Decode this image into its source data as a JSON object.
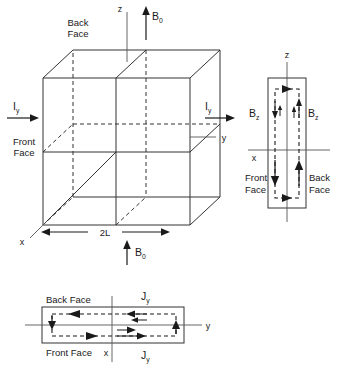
{
  "figure": {
    "panels": [
      "cube-perspective-panel",
      "side-view-panel",
      "top-view-panel"
    ]
  },
  "cube_panel": {
    "name": "cube-perspective-panel",
    "labels": {
      "back_face_line1": "Back",
      "back_face_line2": "Face",
      "front_face_line1": "Front",
      "front_face_line2": "Face",
      "axis_z": "z",
      "axis_x": "x",
      "axis_y": "y",
      "field_top": "B",
      "field_top_sub": "0",
      "field_bottom": "B",
      "field_bottom_sub": "0",
      "current_left": "I",
      "current_left_sub": "y",
      "current_right": "I",
      "current_right_sub": "y",
      "width_label": "2L"
    }
  },
  "side_panel": {
    "name": "side-view-panel",
    "labels": {
      "axis_z": "z",
      "axis_x": "x",
      "field_left": "B",
      "field_left_sub": "z",
      "field_right": "B",
      "field_right_sub": "z",
      "front_face_line1": "Front",
      "front_face_line2": "Face",
      "back_face_line1": "Back",
      "back_face_line2": "Face"
    }
  },
  "top_panel": {
    "name": "top-view-panel",
    "labels": {
      "back_face": "Back Face",
      "front_face": "Front Face",
      "axis_x": "x",
      "axis_y": "y",
      "current_top": "J",
      "current_top_sub": "y",
      "current_bottom": "J",
      "current_bottom_sub": "y"
    }
  },
  "colors": {
    "line": "#333333",
    "text": "#1a1a1a",
    "arrow": "#1a1a1a",
    "background": "#ffffff"
  }
}
